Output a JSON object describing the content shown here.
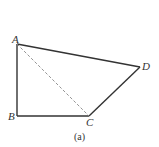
{
  "figure": {
    "caption": "(a)",
    "points": {
      "A": {
        "label": "A",
        "x": 17,
        "y": 44
      },
      "B": {
        "label": "B",
        "x": 17,
        "y": 116
      },
      "C": {
        "label": "C",
        "x": 89,
        "y": 116
      },
      "D": {
        "label": "D",
        "x": 140,
        "y": 67
      }
    },
    "edges": [
      {
        "from": "A",
        "to": "B",
        "style": "solid"
      },
      {
        "from": "B",
        "to": "C",
        "style": "solid"
      },
      {
        "from": "C",
        "to": "D",
        "style": "solid"
      },
      {
        "from": "D",
        "to": "A",
        "style": "solid"
      },
      {
        "from": "A",
        "to": "C",
        "style": "dashed"
      }
    ],
    "colors": {
      "line": "#333333",
      "dashed": "#888888"
    }
  }
}
